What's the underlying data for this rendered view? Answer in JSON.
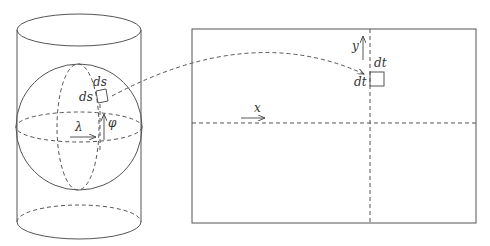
{
  "diagram": {
    "left_figure": {
      "name": "sphere inscribed in cylinder",
      "labels": {
        "ds_top": "ds",
        "ds_left": "ds",
        "lambda": "λ",
        "phi": "φ"
      }
    },
    "right_figure": {
      "name": "projected map plane",
      "labels": {
        "y": "y",
        "x": "x",
        "dt_top": "dt",
        "dt_left": "dt"
      }
    },
    "connector": "dashed arc mapping area element ds×ds to dt×dt"
  }
}
